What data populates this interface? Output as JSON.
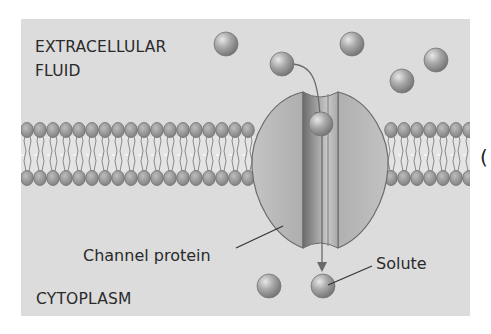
{
  "diagram": {
    "type": "channel-protein-transport",
    "colors": {
      "panel": "#dcdcdc",
      "lipid_head": "#9a9a9a",
      "lipid_head_stroke": "#6e6e6e",
      "lipid_tail": "#8a8a8a",
      "protein": "#b8b8b8",
      "protein_stroke": "#6a6a6a",
      "channel": "#8d8d8d",
      "solute": "#a5a5a5",
      "text": "#2a2a2a"
    },
    "labels": {
      "extracellular_line1": "EXTRACELLULAR",
      "extracellular_line2": "FLUID",
      "cytoplasm": "CYTOPLASM",
      "channel_protein": "Channel protein",
      "solute": "Solute",
      "partial_paren": "("
    },
    "solutes": [
      {
        "x": 226,
        "y": 44
      },
      {
        "x": 282,
        "y": 64
      },
      {
        "x": 352,
        "y": 44
      },
      {
        "x": 402,
        "y": 81
      },
      {
        "x": 436,
        "y": 60
      },
      {
        "x": 321,
        "y": 124
      },
      {
        "x": 269,
        "y": 286
      },
      {
        "x": 323,
        "y": 286
      }
    ]
  }
}
